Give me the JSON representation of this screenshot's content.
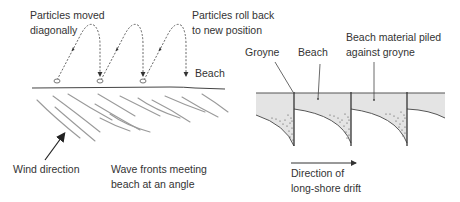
{
  "left_diagram": {
    "title": "Longshore drift particle movement",
    "labels": {
      "particles_moved_line1": "Particles moved",
      "particles_moved_line2": "diagonally",
      "particles_roll_line1": "Particles roll back",
      "particles_roll_line2": "to new position",
      "beach": "Beach",
      "wind_direction": "Wind direction",
      "wave_fronts_line1": "Wave fronts meeting",
      "wave_fronts_line2": "beach at an angle"
    },
    "particle_count": 3
  },
  "right_diagram": {
    "title": "Groynes trapping beach material",
    "labels": {
      "groyne": "Groyne",
      "beach": "Beach",
      "material_line1": "Beach material piled",
      "material_line2": "against groyne",
      "drift_line1": "Direction of",
      "drift_line2": "long-shore drift"
    },
    "groyne_count": 4
  },
  "colors": {
    "ink": "#333333",
    "wave": "#9a9a9a",
    "beach_fill": "#e4e4e4",
    "sediment": "#444444"
  }
}
